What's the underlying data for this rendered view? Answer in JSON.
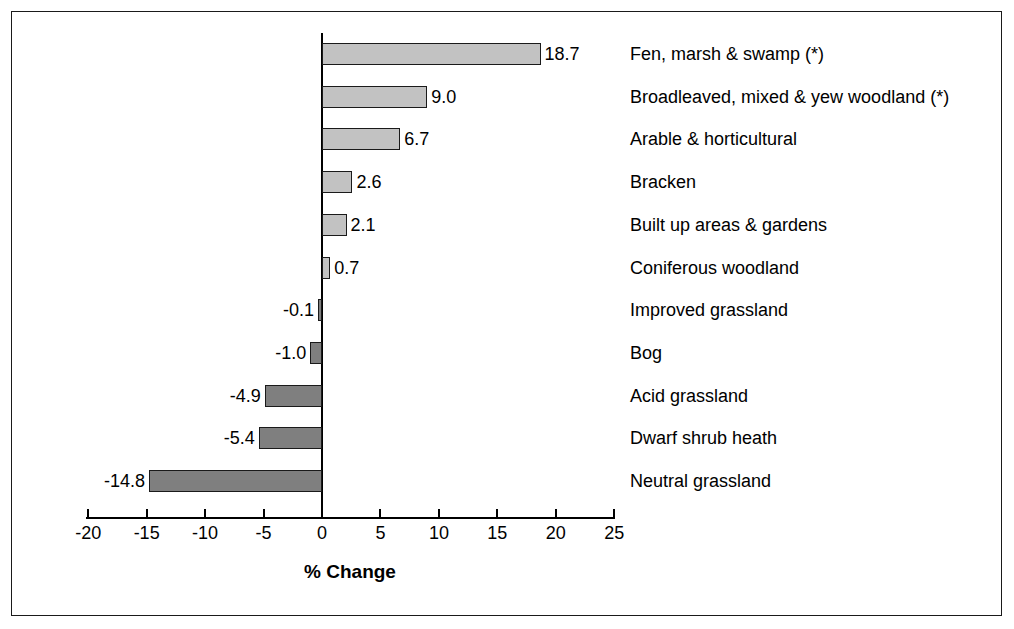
{
  "chart_data": {
    "type": "bar",
    "orientation": "horizontal",
    "title": "",
    "xlabel": "% Change",
    "ylabel": "",
    "xlim": [
      -20,
      25
    ],
    "xticks": [
      -20,
      -15,
      -10,
      -5,
      0,
      5,
      10,
      15,
      20,
      25
    ],
    "xtick_labels": [
      "-20",
      "-15",
      "-10",
      "-5",
      "0",
      "5",
      "10",
      "15",
      "20",
      "25"
    ],
    "grid": false,
    "legend": null,
    "categories": [
      "Fen, marsh & swamp (*)",
      "Broadleaved, mixed & yew woodland (*)",
      "Arable & horticultural",
      "Bracken",
      "Built up areas & gardens",
      "Coniferous woodland",
      "Improved grassland",
      "Bog",
      "Acid grassland",
      "Dwarf shrub heath",
      "Neutral grassland"
    ],
    "values": [
      18.7,
      9.0,
      6.7,
      2.6,
      2.1,
      0.7,
      -0.1,
      -1.0,
      -4.9,
      -5.4,
      -14.8
    ],
    "value_labels": [
      "18.7",
      "9.0",
      "6.7",
      "2.6",
      "2.1",
      "0.7",
      "-0.1",
      "-1.0",
      "-4.9",
      "-5.4",
      "-14.8"
    ],
    "colors": {
      "positive_fill": "#c2c2c2",
      "negative_fill": "#7f7f7f",
      "bar_border": "#1a1a1a",
      "axis": "#000000",
      "frame": "#1a1a1a",
      "background": "#ffffff"
    }
  }
}
